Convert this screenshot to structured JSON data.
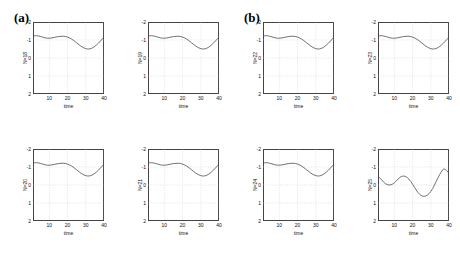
{
  "figure": {
    "panels": [
      {
        "label": "(a)"
      },
      {
        "label": "(b)"
      }
    ]
  },
  "axis": {
    "xlabel": "time",
    "xticks": [
      "10",
      "20",
      "30",
      "40"
    ],
    "yticks": [
      "2",
      "1",
      "0",
      "-1",
      "-2"
    ]
  },
  "chart_data": {
    "type": "line",
    "title": "",
    "panels": [
      {
        "label": "(a)",
        "subplots": [
          {
            "ylabel": "N=18",
            "xlabel": "time",
            "xlim": [
              1,
              40
            ],
            "ylim": [
              -2,
              2
            ],
            "xticks": [
              10,
              20,
              30,
              40
            ],
            "yticks": [
              -2,
              -1,
              0,
              1,
              2
            ],
            "grid": true,
            "x": [
              1,
              3,
              5,
              7,
              9,
              11,
              13,
              15,
              17,
              19,
              21,
              23,
              25,
              27,
              29,
              31,
              33,
              35,
              37,
              39,
              40
            ],
            "y": [
              1.22,
              1.24,
              1.2,
              1.14,
              1.1,
              1.11,
              1.15,
              1.19,
              1.21,
              1.19,
              1.12,
              1.0,
              0.84,
              0.68,
              0.56,
              0.5,
              0.53,
              0.65,
              0.83,
              1.05,
              1.15
            ]
          },
          {
            "ylabel": "N=19",
            "xlabel": "time",
            "xlim": [
              1,
              40
            ],
            "ylim": [
              -2,
              2
            ],
            "xticks": [
              10,
              20,
              30,
              40
            ],
            "yticks": [
              -2,
              -1,
              0,
              1,
              2
            ],
            "grid": true,
            "x": [
              1,
              3,
              5,
              7,
              9,
              11,
              13,
              15,
              17,
              19,
              21,
              23,
              25,
              27,
              29,
              31,
              33,
              35,
              37,
              39,
              40
            ],
            "y": [
              1.22,
              1.24,
              1.2,
              1.14,
              1.1,
              1.11,
              1.15,
              1.19,
              1.21,
              1.19,
              1.12,
              1.0,
              0.84,
              0.68,
              0.56,
              0.5,
              0.53,
              0.65,
              0.83,
              1.05,
              1.15
            ]
          },
          {
            "ylabel": "N=20",
            "xlabel": "time",
            "xlim": [
              1,
              40
            ],
            "ylim": [
              -2,
              2
            ],
            "xticks": [
              10,
              20,
              30,
              40
            ],
            "yticks": [
              -2,
              -1,
              0,
              1,
              2
            ],
            "grid": true,
            "x": [
              1,
              3,
              5,
              7,
              9,
              11,
              13,
              15,
              17,
              19,
              21,
              23,
              25,
              27,
              29,
              31,
              33,
              35,
              37,
              39,
              40
            ],
            "y": [
              1.22,
              1.24,
              1.2,
              1.14,
              1.1,
              1.11,
              1.15,
              1.19,
              1.21,
              1.19,
              1.12,
              1.0,
              0.84,
              0.68,
              0.56,
              0.5,
              0.53,
              0.65,
              0.83,
              1.05,
              1.15
            ]
          },
          {
            "ylabel": "N=21",
            "xlabel": "time",
            "xlim": [
              1,
              40
            ],
            "ylim": [
              -2,
              2
            ],
            "xticks": [
              10,
              20,
              30,
              40
            ],
            "yticks": [
              -2,
              -1,
              0,
              1,
              2
            ],
            "grid": true,
            "x": [
              1,
              3,
              5,
              7,
              9,
              11,
              13,
              15,
              17,
              19,
              21,
              23,
              25,
              27,
              29,
              31,
              33,
              35,
              37,
              39,
              40
            ],
            "y": [
              1.22,
              1.24,
              1.2,
              1.14,
              1.1,
              1.11,
              1.15,
              1.19,
              1.21,
              1.19,
              1.12,
              1.0,
              0.84,
              0.68,
              0.56,
              0.5,
              0.53,
              0.65,
              0.83,
              1.05,
              1.15
            ]
          }
        ]
      },
      {
        "label": "(b)",
        "subplots": [
          {
            "ylabel": "N=22",
            "xlabel": "time",
            "xlim": [
              1,
              40
            ],
            "ylim": [
              -2,
              2
            ],
            "xticks": [
              10,
              20,
              30,
              40
            ],
            "yticks": [
              -2,
              -1,
              0,
              1,
              2
            ],
            "grid": true,
            "x": [
              1,
              3,
              5,
              7,
              9,
              11,
              13,
              15,
              17,
              19,
              21,
              23,
              25,
              27,
              29,
              31,
              33,
              35,
              37,
              39,
              40
            ],
            "y": [
              1.22,
              1.24,
              1.2,
              1.14,
              1.1,
              1.11,
              1.15,
              1.19,
              1.21,
              1.19,
              1.12,
              1.0,
              0.84,
              0.68,
              0.56,
              0.5,
              0.53,
              0.65,
              0.83,
              1.05,
              1.15
            ]
          },
          {
            "ylabel": "N=23",
            "xlabel": "time",
            "xlim": [
              1,
              40
            ],
            "ylim": [
              -2,
              2
            ],
            "xticks": [
              10,
              20,
              30,
              40
            ],
            "yticks": [
              -2,
              -1,
              0,
              1,
              2
            ],
            "grid": true,
            "x": [
              1,
              3,
              5,
              7,
              9,
              11,
              13,
              15,
              17,
              19,
              21,
              23,
              25,
              27,
              29,
              31,
              33,
              35,
              37,
              39,
              40
            ],
            "y": [
              1.22,
              1.24,
              1.2,
              1.14,
              1.1,
              1.11,
              1.15,
              1.19,
              1.21,
              1.19,
              1.12,
              1.0,
              0.84,
              0.68,
              0.56,
              0.5,
              0.53,
              0.65,
              0.83,
              1.05,
              1.15
            ]
          },
          {
            "ylabel": "N=24",
            "xlabel": "time",
            "xlim": [
              1,
              40
            ],
            "ylim": [
              -2,
              2
            ],
            "xticks": [
              10,
              20,
              30,
              40
            ],
            "yticks": [
              -2,
              -1,
              0,
              1,
              2
            ],
            "grid": true,
            "x": [
              1,
              3,
              5,
              7,
              9,
              11,
              13,
              15,
              17,
              19,
              21,
              23,
              25,
              27,
              29,
              31,
              33,
              35,
              37,
              39,
              40
            ],
            "y": [
              1.22,
              1.24,
              1.2,
              1.14,
              1.1,
              1.11,
              1.15,
              1.19,
              1.21,
              1.19,
              1.12,
              1.0,
              0.84,
              0.68,
              0.56,
              0.5,
              0.53,
              0.65,
              0.83,
              1.05,
              1.15
            ]
          },
          {
            "ylabel": "N=25",
            "xlabel": "time",
            "xlim": [
              1,
              40
            ],
            "ylim": [
              -2,
              2
            ],
            "xticks": [
              10,
              20,
              30,
              40
            ],
            "yticks": [
              -2,
              -1,
              0,
              1,
              2
            ],
            "grid": true,
            "x": [
              1,
              3,
              5,
              7,
              9,
              11,
              13,
              15,
              17,
              19,
              21,
              23,
              25,
              27,
              29,
              31,
              33,
              35,
              37,
              39,
              40
            ],
            "y": [
              0.5,
              0.28,
              0.08,
              0.0,
              0.05,
              0.22,
              0.42,
              0.5,
              0.42,
              0.2,
              -0.12,
              -0.42,
              -0.6,
              -0.62,
              -0.48,
              -0.2,
              0.2,
              0.6,
              0.88,
              0.78,
              0.62
            ]
          }
        ]
      }
    ],
    "line_color": "#4d4d4d",
    "grid_color": "#bbbbbb"
  }
}
